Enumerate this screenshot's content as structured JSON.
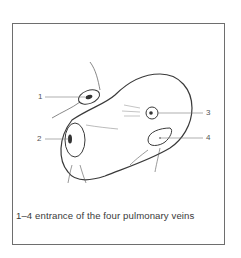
{
  "figure": {
    "caption": "1–4  entrance of the four pulmonary veins",
    "labels": [
      {
        "id": "1",
        "text": "1"
      },
      {
        "id": "2",
        "text": "2"
      },
      {
        "id": "3",
        "text": "3"
      },
      {
        "id": "4",
        "text": "4"
      }
    ],
    "colors": {
      "line": "#3a3a3a",
      "leader": "#7a7a7a",
      "border": "#6e6e6e"
    }
  }
}
